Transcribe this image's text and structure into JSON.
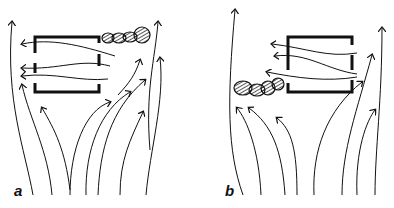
{
  "figure": {
    "panels": [
      {
        "label": "a",
        "description": "Airflow streamlines rising around an open-sided enclosure; smoke plume trails from upper right corner"
      },
      {
        "label": "b",
        "description": "Airflow streamlines rising around an open-sided enclosure; smoke plume trails from lower left corner"
      }
    ],
    "colors": {
      "ink": "#111111",
      "background": "#ffffff"
    }
  }
}
